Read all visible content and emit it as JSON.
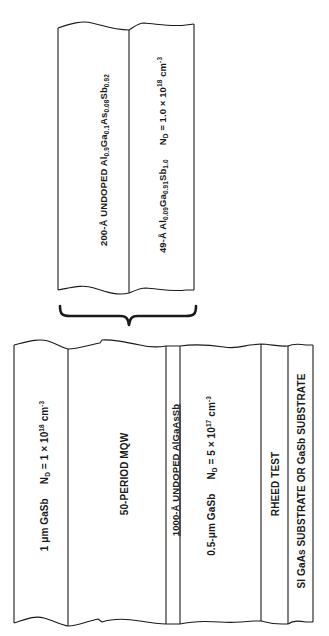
{
  "figure": {
    "type": "epitaxial layer structure diagram",
    "colors": {
      "line": "#1a1a1a",
      "background": "#ffffff",
      "text": "#1a1a1a"
    },
    "expanded_detail": {
      "description": "One period of the multiple quantum well (expanded from 50-PERIOD MQW)",
      "layers": [
        {
          "thickness": "200-Å",
          "prefix": "UNDOPED",
          "material_parts": [
            "Al",
            "0.9",
            "Ga",
            "0.1",
            "As",
            "0.08",
            "Sb",
            "0.92"
          ],
          "label": "200-Å UNDOPED Al0.9Ga0.1As0.08Sb0.92"
        },
        {
          "thickness": "49-Å",
          "material_parts": [
            "Al",
            "0.09",
            "Ga",
            "0.91",
            "Sb",
            "1.0"
          ],
          "doping_prefix": "N",
          "doping_sub": "D",
          "doping_value": "= 1.0 × 10",
          "doping_exp": "18",
          "doping_unit": "cm",
          "doping_unit_exp": "-3",
          "label": "49-Å Al0.09Ga0.91Sb1.0  ND = 1.0 × 10^18 cm^-3"
        }
      ]
    },
    "brace": {
      "label": "expands-from",
      "points_to": "50-PERIOD MQW"
    },
    "stack": {
      "layers": [
        {
          "name": "cap",
          "text": "1 μm GaSb",
          "doping_prefix": "N",
          "doping_sub": "D",
          "doping_value": "= 1 × 10",
          "doping_exp": "18",
          "doping_unit": "cm",
          "doping_unit_exp": "-3"
        },
        {
          "name": "mqw",
          "text": "50-PERIOD MQW"
        },
        {
          "name": "barrier",
          "text": "1000-Å UNDOPED AlGaAsSb"
        },
        {
          "name": "contact",
          "text": "0.5-μm GaSb",
          "doping_prefix": "N",
          "doping_sub": "D",
          "doping_value": "= 5 × 10",
          "doping_exp": "17",
          "doping_unit": "cm",
          "doping_unit_exp": "-3"
        },
        {
          "name": "rheed",
          "text": "RHEED TEST"
        },
        {
          "name": "substrate",
          "text": "SI GaAs SUBSTRATE OR GaSb SUBSTRATE"
        }
      ]
    }
  }
}
